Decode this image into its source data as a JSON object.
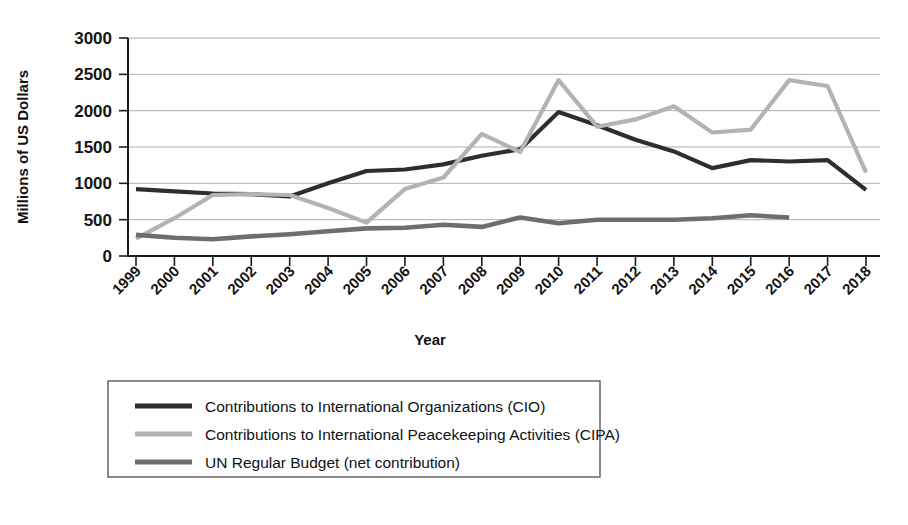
{
  "chart_data": {
    "type": "line",
    "title": "",
    "xlabel": "Year",
    "ylabel": "Millions of US Dollars",
    "ylim": [
      0,
      3000
    ],
    "yticks": [
      0,
      500,
      1000,
      1500,
      2000,
      2500,
      3000
    ],
    "ytick_labels": [
      "0",
      "500",
      "1000",
      "1500",
      "2000",
      "2500",
      "3000"
    ],
    "grid": true,
    "legend_position": "below-center",
    "categories": [
      "1999",
      "2000",
      "2001",
      "2002",
      "2003",
      "2004",
      "2005",
      "2006",
      "2007",
      "2008",
      "2009",
      "2010",
      "2011",
      "2012",
      "2013",
      "2014",
      "2015",
      "2016",
      "2017",
      "2018"
    ],
    "series": [
      {
        "name": "Contributions to International Organizations (CIO)",
        "short_name": "CIO",
        "color": "#2e2e2e",
        "width": 4.2,
        "values": [
          920,
          890,
          860,
          850,
          820,
          1000,
          1170,
          1190,
          1260,
          1380,
          1470,
          1980,
          1800,
          1600,
          1440,
          1210,
          1320,
          1300,
          1320,
          910
        ]
      },
      {
        "name": "Contributions to International Peacekeeping Activities (CIPA)",
        "short_name": "CIPA",
        "color": "#b3b3b3",
        "width": 4.2,
        "values": [
          240,
          520,
          840,
          850,
          840,
          660,
          460,
          920,
          1080,
          1680,
          1430,
          2420,
          1780,
          1880,
          2060,
          1700,
          1740,
          2420,
          2340,
          1150
        ]
      },
      {
        "name": "UN Regular Budget (net contribution)",
        "short_name": "UN Regular Budget",
        "color": "#6e6e6e",
        "width": 4.6,
        "values": [
          290,
          250,
          230,
          270,
          300,
          340,
          380,
          390,
          430,
          400,
          530,
          450,
          500,
          500,
          500,
          520,
          560,
          530,
          null,
          null
        ]
      }
    ]
  },
  "legend": {
    "entries": [
      {
        "label": "Contributions to International Organizations (CIO)",
        "color": "#2e2e2e"
      },
      {
        "label": "Contributions to International Peacekeeping Activities (CIPA)",
        "color": "#b3b3b3"
      },
      {
        "label": "UN Regular Budget (net contribution)",
        "color": "#6e6e6e"
      }
    ]
  },
  "colors": {
    "cio": "#2e2e2e",
    "cipa": "#b3b3b3",
    "un": "#6e6e6e",
    "grid": "#9a9a9a",
    "axis": "#1c1c1c",
    "background": "#ffffff"
  }
}
